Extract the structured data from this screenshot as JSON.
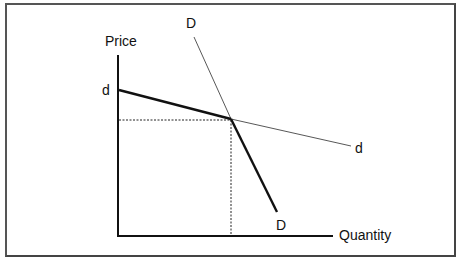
{
  "diagram": {
    "type": "kinked-demand-curve",
    "axes": {
      "y_label": "Price",
      "x_label": "Quantity"
    },
    "curves": [
      {
        "name": "d",
        "label_start": "d",
        "label_end": "d",
        "description": "Elastic demand curve (rivals don't follow price changes)"
      },
      {
        "name": "D",
        "label_start": "D",
        "label_end": "D",
        "description": "Inelastic demand curve (rivals follow price changes)"
      }
    ],
    "labels": {
      "d_left": "d",
      "d_right": "d",
      "D_top": "D",
      "D_bottom": "D"
    },
    "colors": {
      "line": "#111111",
      "thin_line": "#555555",
      "border": "#555555"
    }
  }
}
